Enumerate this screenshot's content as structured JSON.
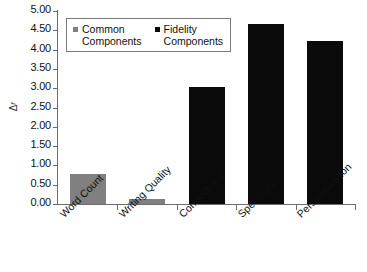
{
  "chart_data": {
    "type": "bar",
    "title": "",
    "xlabel": "",
    "ylabel": "Δf",
    "ylim": [
      0,
      5
    ],
    "ytick_step": 0.5,
    "grid": false,
    "legend_position": "top-left",
    "categories": [
      "Word Count",
      "Writing Quality",
      "Connections",
      "Specificity",
      "Personalization"
    ],
    "values": [
      0.77,
      0.14,
      3.02,
      4.66,
      4.22
    ],
    "point_series": [
      "Common Components",
      "Common Components",
      "Fidelity Components",
      "Fidelity Components",
      "Fidelity Components"
    ],
    "series": [
      {
        "name": "Common Components",
        "color": "#808080",
        "points": [
          {
            "category": "Word Count",
            "value": 0.77
          },
          {
            "category": "Writing Quality",
            "value": 0.14
          }
        ]
      },
      {
        "name": "Fidelity Components",
        "color": "#0a0a0a",
        "points": [
          {
            "category": "Connections",
            "value": 3.02
          },
          {
            "category": "Specificity",
            "value": 4.66
          },
          {
            "category": "Personalization",
            "value": 4.22
          }
        ]
      }
    ],
    "ytick_labels": [
      "0.00",
      "0.50",
      "1.00",
      "1.50",
      "2.00",
      "2.50",
      "3.00",
      "3.50",
      "4.00",
      "4.50",
      "5.00"
    ],
    "ytick_values": [
      0,
      0.5,
      1,
      1.5,
      2,
      2.5,
      3,
      3.5,
      4,
      4.5,
      5
    ]
  },
  "axis": {
    "y_title_main": "Δ",
    "y_title_sub": "f"
  },
  "legend": {
    "entries": [
      {
        "label": "Common\nComponents",
        "color": "#808080"
      },
      {
        "label": "Fidelity\nComponents",
        "color": "#0a0a0a"
      }
    ]
  },
  "colors": {
    "common": "#808080",
    "fidelity": "#0a0a0a",
    "axis": "#6e6e6e",
    "text": "#111111",
    "background": "#ffffff"
  }
}
